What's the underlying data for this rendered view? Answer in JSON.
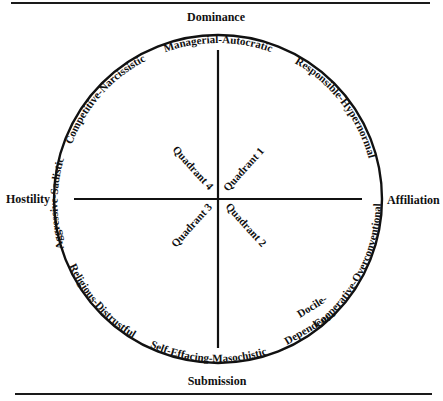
{
  "figure": {
    "poles": {
      "top": "Dominance",
      "bottom": "Submission",
      "left": "Hostility",
      "right": "Affiliation"
    },
    "arc_labels": {
      "managerial": "Managerial-Autocratic",
      "responsible": "Responsible-Hypernormal",
      "cooperative": "Cooperative-Overconventional",
      "docile_line1": "Docile-",
      "docile_line2": "Dependent",
      "self_effacing": "Self-Effacing-Masochistic",
      "religious": "Religious-Distrustful",
      "aggressive": "Aggressive-Sadistic",
      "competitive": "Competitive-Narcissistic"
    },
    "quadrants": {
      "q1": "Quadrant 1",
      "q2": "Quadrant 2",
      "q3": "Quadrant 3",
      "q4": "Quadrant 4"
    },
    "colors": {
      "ink": "#111111",
      "background": "#ffffff"
    }
  }
}
